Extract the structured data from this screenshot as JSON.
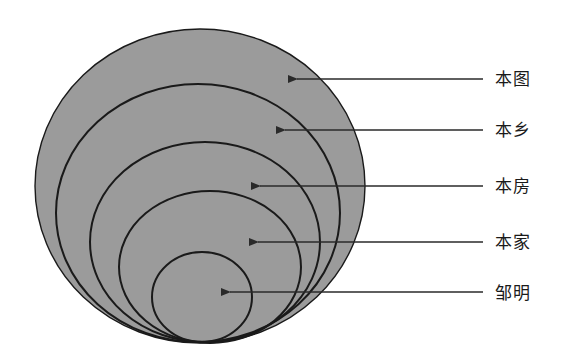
{
  "diagram": {
    "title": "",
    "type": "nested-circles",
    "fill_color": "#9b9b9b",
    "stroke_color": "#1a1a1a",
    "arrow_color": "#2a2a2a",
    "levels": [
      {
        "label": "本图",
        "ellipse": {
          "cx": 200,
          "cy": 186,
          "rx": 165,
          "ry": 157
        },
        "arrow": {
          "x1": 483,
          "x2": 297,
          "y": 79
        },
        "label_pos": {
          "x": 495,
          "y": 69
        }
      },
      {
        "label": "本乡",
        "ellipse": {
          "cx": 198,
          "cy": 213,
          "rx": 142,
          "ry": 129
        },
        "arrow": {
          "x1": 483,
          "x2": 285,
          "y": 130
        },
        "label_pos": {
          "x": 495,
          "y": 120
        }
      },
      {
        "label": "本房",
        "ellipse": {
          "cx": 205,
          "cy": 242,
          "rx": 115,
          "ry": 100
        },
        "arrow": {
          "x1": 483,
          "x2": 260,
          "y": 186
        },
        "label_pos": {
          "x": 495,
          "y": 176
        }
      },
      {
        "label": "本家",
        "ellipse": {
          "cx": 210,
          "cy": 267,
          "rx": 91,
          "ry": 76
        },
        "arrow": {
          "x1": 483,
          "x2": 258,
          "y": 242
        },
        "label_pos": {
          "x": 495,
          "y": 232
        }
      },
      {
        "label": "邹明",
        "ellipse": {
          "cx": 202,
          "cy": 297,
          "rx": 50,
          "ry": 45
        },
        "arrow": {
          "x1": 483,
          "x2": 230,
          "y": 292
        },
        "label_pos": {
          "x": 495,
          "y": 283
        }
      }
    ]
  }
}
